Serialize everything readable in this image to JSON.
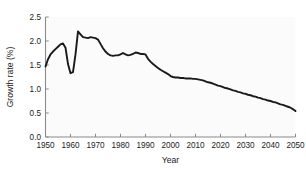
{
  "figure": {
    "background_color": "#ffffff",
    "plot_background_color": "#fbfbfb",
    "axis_color": "#8a8a8a",
    "line_color": "#1a1a1a"
  },
  "chart_data": {
    "type": "line",
    "title": "",
    "xlabel": "Year",
    "ylabel": "Growth rate (%)",
    "xlim": [
      1950,
      2050
    ],
    "ylim": [
      0.0,
      2.5
    ],
    "xticks": [
      1950,
      1960,
      1970,
      1980,
      1990,
      2000,
      2010,
      2020,
      2030,
      2040,
      2050
    ],
    "xtick_labels": [
      "1950",
      "1960",
      "1970",
      "1980",
      "1990",
      "2000",
      "2010",
      "2020",
      "2030",
      "2040",
      "2050"
    ],
    "yticks": [
      0.0,
      0.5,
      1.0,
      1.5,
      2.0,
      2.5
    ],
    "ytick_labels": [
      "0.0",
      "0.5",
      "1.0",
      "1.5",
      "2.0",
      "2.5"
    ],
    "grid": false,
    "legend": null,
    "series": [
      {
        "name": "World population growth rate",
        "color": "#1a1a1a",
        "x": [
          1950,
          1951,
          1952,
          1953,
          1954,
          1955,
          1956,
          1957,
          1958,
          1959,
          1960,
          1961,
          1962,
          1963,
          1964,
          1965,
          1966,
          1967,
          1968,
          1969,
          1970,
          1971,
          1972,
          1973,
          1974,
          1975,
          1976,
          1977,
          1978,
          1979,
          1980,
          1981,
          1982,
          1983,
          1984,
          1985,
          1986,
          1987,
          1988,
          1989,
          1990,
          1991,
          1992,
          1993,
          1994,
          1995,
          1996,
          1997,
          1998,
          1999,
          2000,
          2001,
          2002,
          2003,
          2004,
          2005,
          2006,
          2007,
          2008,
          2009,
          2010,
          2011,
          2012,
          2013,
          2014,
          2015,
          2016,
          2017,
          2018,
          2019,
          2020,
          2021,
          2022,
          2023,
          2024,
          2025,
          2026,
          2027,
          2028,
          2029,
          2030,
          2031,
          2032,
          2033,
          2034,
          2035,
          2036,
          2037,
          2038,
          2039,
          2040,
          2041,
          2042,
          2043,
          2044,
          2045,
          2046,
          2047,
          2048,
          2049,
          2050
        ],
        "y": [
          1.47,
          1.62,
          1.72,
          1.78,
          1.83,
          1.88,
          1.93,
          1.95,
          1.86,
          1.52,
          1.33,
          1.35,
          1.72,
          2.2,
          2.14,
          2.08,
          2.07,
          2.06,
          2.08,
          2.07,
          2.06,
          2.03,
          1.94,
          1.85,
          1.78,
          1.73,
          1.7,
          1.69,
          1.7,
          1.7,
          1.72,
          1.75,
          1.72,
          1.7,
          1.71,
          1.73,
          1.76,
          1.75,
          1.73,
          1.73,
          1.72,
          1.63,
          1.57,
          1.52,
          1.48,
          1.44,
          1.4,
          1.37,
          1.34,
          1.31,
          1.27,
          1.25,
          1.24,
          1.24,
          1.23,
          1.23,
          1.22,
          1.22,
          1.22,
          1.21,
          1.21,
          1.2,
          1.19,
          1.18,
          1.16,
          1.14,
          1.13,
          1.11,
          1.09,
          1.07,
          1.06,
          1.04,
          1.02,
          1.01,
          0.99,
          0.97,
          0.96,
          0.94,
          0.93,
          0.91,
          0.9,
          0.88,
          0.87,
          0.85,
          0.84,
          0.82,
          0.81,
          0.79,
          0.78,
          0.76,
          0.75,
          0.73,
          0.72,
          0.7,
          0.68,
          0.67,
          0.65,
          0.63,
          0.61,
          0.58,
          0.54
        ]
      }
    ]
  }
}
